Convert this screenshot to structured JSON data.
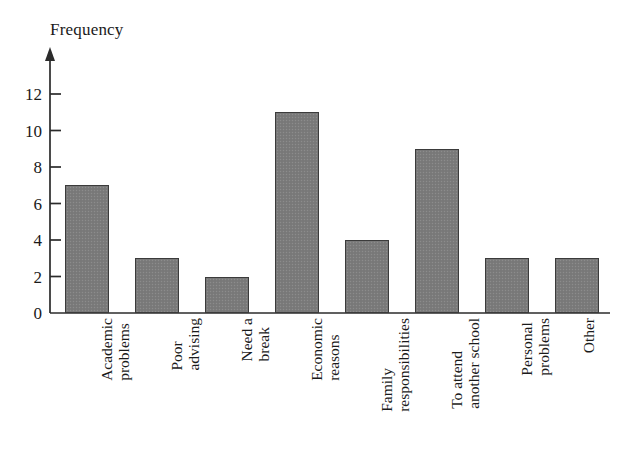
{
  "chart_data": {
    "type": "bar",
    "title": "",
    "subtitle": "",
    "xlabel": "",
    "ylabel": "Frequency",
    "ylim": [
      0,
      13
    ],
    "grid": false,
    "legend": false,
    "y_ticks": [
      0,
      2,
      4,
      6,
      8,
      10,
      12
    ],
    "y_tick_labels": [
      "0",
      "2",
      "4",
      "6",
      "8",
      "10",
      "12"
    ],
    "categories": [
      "Academic problems",
      "Poor advising",
      "Need a break",
      "Economic reasons",
      "Family responsibilities",
      "To attend another school",
      "Personal problems",
      "Other"
    ],
    "category_label_lines": [
      [
        "Academic",
        "problems"
      ],
      [
        "Poor",
        "advising"
      ],
      [
        "Need a",
        "break"
      ],
      [
        "Economic",
        "reasons"
      ],
      [
        "Family",
        "responsibilities"
      ],
      [
        "To attend",
        "another school"
      ],
      [
        "Personal",
        "problems"
      ],
      [
        "Other"
      ]
    ],
    "values": [
      7,
      3,
      2,
      11,
      4,
      9,
      3,
      3
    ],
    "bar_color": "#7b7b7b",
    "bar_border_color": "#3b3b3b",
    "axis_color": "#2b2b2b",
    "background_color": "#ffffff"
  },
  "axis": {
    "y_title": "Frequency",
    "arrow_head": "y-axis-arrow"
  }
}
